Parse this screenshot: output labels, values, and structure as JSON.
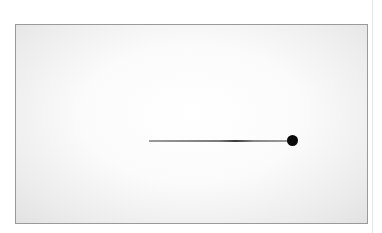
{
  "image": {
    "description": "Framed grayscale photo with vignette showing a thin horizontal line ending in a black dot",
    "colors": {
      "frame_border": "#9a9a9a",
      "dot": "#0a0a0a",
      "background": "#ffffff"
    }
  }
}
